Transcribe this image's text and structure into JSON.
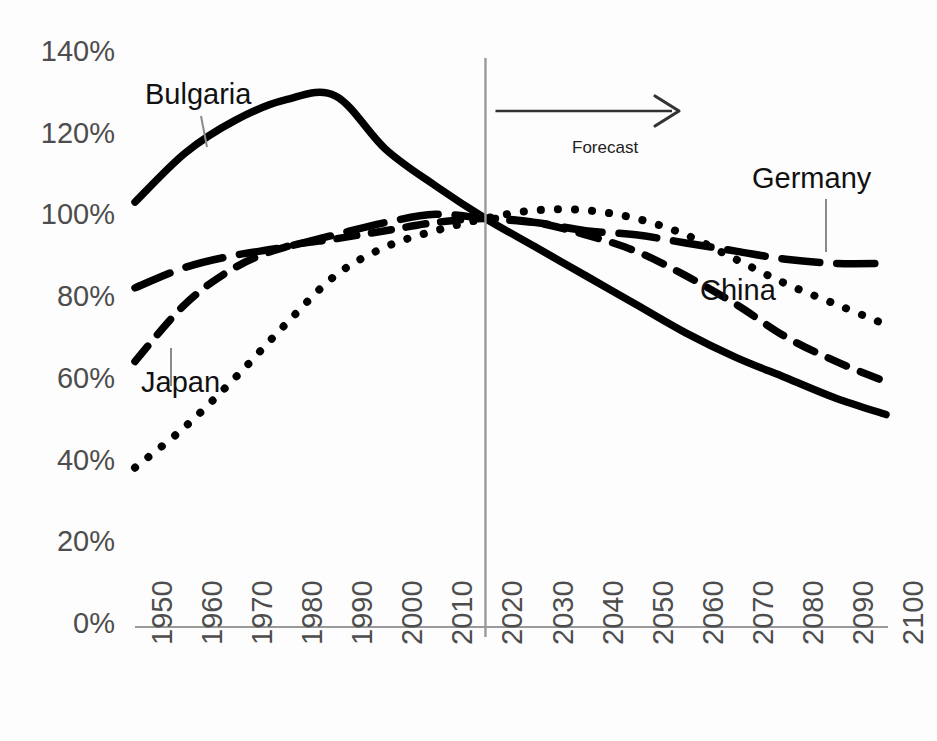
{
  "chart_data": {
    "type": "line",
    "title": "",
    "subtitle": "",
    "xlabel": "",
    "ylabel": "",
    "xlim": [
      1950,
      2100
    ],
    "ylim": [
      0,
      140
    ],
    "grid": false,
    "legend_position": "inline-annotations",
    "x_tick_labels": [
      "1950",
      "1960",
      "1970",
      "1980",
      "1990",
      "2000",
      "2010",
      "2020",
      "2030",
      "2040",
      "2050",
      "2060",
      "2070",
      "2080",
      "2090",
      "2100"
    ],
    "y_tick_labels": [
      "140%",
      "120%",
      "100%",
      "80%",
      "60%",
      "40%",
      "20%",
      "0%"
    ],
    "y_tick_values": [
      140,
      120,
      100,
      80,
      60,
      40,
      20,
      0
    ],
    "x": [
      1950,
      1960,
      1970,
      1980,
      1990,
      2000,
      2010,
      2020,
      2030,
      2040,
      2050,
      2060,
      2070,
      2080,
      2090,
      2100
    ],
    "series": [
      {
        "name": "Bulgaria",
        "style": "solid",
        "color": "#000000",
        "values": [
          104,
          116,
          124,
          129,
          130,
          117,
          108,
          100,
          93,
          86,
          79,
          72,
          66,
          61,
          56,
          52
        ]
      },
      {
        "name": "Germany",
        "style": "long-dash",
        "color": "#000000",
        "values": [
          83,
          88,
          91,
          93,
          96,
          99,
          101,
          100,
          99,
          97,
          96,
          94,
          92,
          90,
          89,
          89
        ]
      },
      {
        "name": "Japan",
        "style": "dash",
        "color": "#000000",
        "values": [
          65,
          79,
          88,
          93,
          95,
          97,
          99,
          100,
          99,
          96,
          92,
          86,
          79,
          71,
          65,
          60
        ]
      },
      {
        "name": "China",
        "style": "dotted",
        "color": "#000000",
        "values": [
          39,
          49,
          61,
          74,
          86,
          93,
          97,
          100,
          102,
          102,
          100,
          96,
          90,
          84,
          79,
          74
        ]
      }
    ],
    "annotations": [
      {
        "name": "forecast-annotation",
        "label": "Forecast",
        "at_year": 2020,
        "direction": "right"
      },
      {
        "name": "divider-line",
        "label": "",
        "at_year": 2020
      }
    ],
    "series_label_positions": [
      {
        "name": "Bulgaria",
        "x": 145,
        "y": 78
      },
      {
        "name": "Japan",
        "x": 141,
        "y": 366
      },
      {
        "name": "China",
        "x": 700,
        "y": 274
      },
      {
        "name": "Germany",
        "x": 752,
        "y": 162
      }
    ]
  },
  "labels": {
    "bulgaria": "Bulgaria",
    "germany": "Germany",
    "japan": "Japan",
    "china": "China",
    "forecast": "Forecast"
  },
  "axis": {
    "y_ticks": [
      "140%",
      "120%",
      "100%",
      "80%",
      "60%",
      "40%",
      "20%",
      "0%"
    ],
    "x_ticks": [
      "1950",
      "1960",
      "1970",
      "1980",
      "1990",
      "2000",
      "2010",
      "2020",
      "2030",
      "2040",
      "2050",
      "2060",
      "2070",
      "2080",
      "2090",
      "2100"
    ]
  },
  "colors": {
    "background": "#fdfdfd",
    "line": "#000000",
    "axis": "#9a9a9a",
    "tick_text": "#4d4d4d",
    "label_text": "#111111"
  }
}
